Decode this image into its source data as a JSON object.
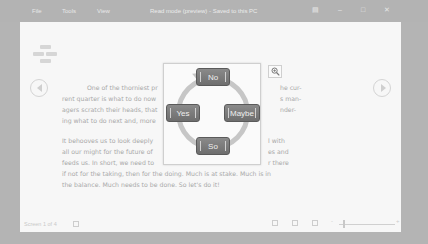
{
  "titlebar": {
    "menu": [
      "File",
      "Tools",
      "View"
    ],
    "title": "Read mode (preview) - Saved to this PC",
    "controls": {
      "layout_icon": "layout-icon",
      "minimize_icon": "minimize-icon",
      "maximize_icon": "maximize-icon",
      "close_icon": "close-icon"
    }
  },
  "document": {
    "paragraph1": [
      "One of the thorniest pr",
      "rent quarter is what to do now",
      "agers scratch their heads, that",
      "ing what to do next and, more"
    ],
    "paragraph1_right": [
      "he cur-",
      "s man-",
      "nder-"
    ],
    "paragraph2": [
      "It behooves us to look deeply",
      "all our might for the future of",
      "feeds us. In short, we need to",
      "if not for the taking, then for the doing. Much is at stake. Much is in",
      "the balance. Much needs to be done. So let's do it!"
    ],
    "paragraph2_right": [
      "l with",
      "es and",
      "r there"
    ]
  },
  "popup": {
    "cycle": {
      "top": "No",
      "left": "Yes",
      "right": "Maybe",
      "bottom": "So"
    },
    "zoom_icon": "zoom-in-icon"
  },
  "navigation": {
    "prev_icon": "previous-page-icon",
    "next_icon": "next-page-icon"
  },
  "statusbar": {
    "page_label": "Screen 1 of 4",
    "view_icons": [
      "read-mode-icon",
      "print-layout-icon",
      "web-layout-icon"
    ],
    "zoom_minus": "-",
    "zoom_plus": "+"
  },
  "colors": {
    "overlay": "#b4b4b4",
    "page_bg": "#f7f7f7",
    "button_fill": "#7a7a7a",
    "ring": "#c6c6c6"
  }
}
